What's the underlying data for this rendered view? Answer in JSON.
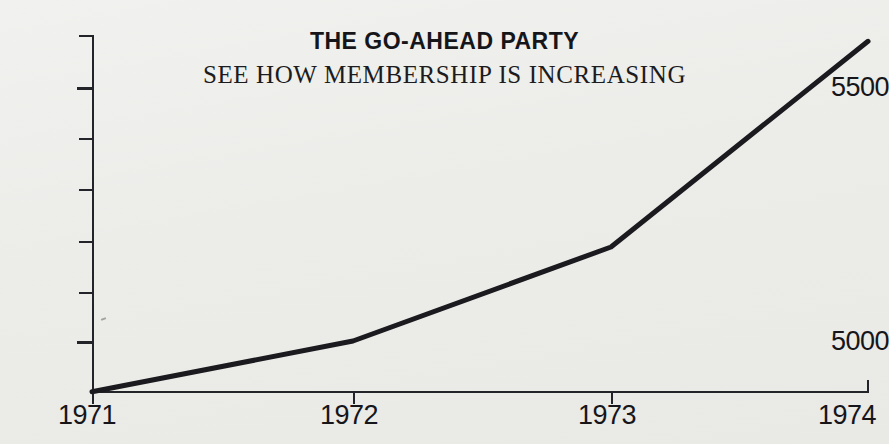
{
  "chart_data": {
    "type": "line",
    "title": "THE GO-AHEAD PARTY",
    "subtitle": "SEE HOW MEMBERSHIP IS INCREASING",
    "xlabel": "",
    "ylabel": "",
    "x": [
      "1971",
      "1972",
      "1973",
      "1974"
    ],
    "categories": [
      "1971",
      "1972",
      "1973",
      "1974"
    ],
    "values": [
      4900,
      5000,
      5185,
      5590
    ],
    "series": [
      {
        "name": "Membership",
        "values": [
          4900,
          5000,
          5185,
          5590
        ]
      }
    ],
    "xlim": [
      "1971",
      "1974"
    ],
    "ylim": [
      4900,
      5600
    ],
    "y_tick_labels": [
      "5500",
      "5000"
    ],
    "y_labeled_ticks": [
      5500,
      5000
    ],
    "y_minor_ticks": [
      5600,
      5400,
      5300,
      5200,
      5100
    ],
    "x_tick_labels": [
      "1971",
      "1972",
      "1973",
      "1974"
    ],
    "grid": false,
    "legend": false,
    "legend_position": "none",
    "line_color": "#1a1a1f",
    "background_color": "#eceae7",
    "note": "Truncated y-axis starting near 4900 exaggerates the rise in membership."
  },
  "axis": {
    "y_labels": [
      {
        "text": "5500"
      },
      {
        "text": "5000"
      }
    ],
    "x_labels": [
      {
        "text": "1971"
      },
      {
        "text": "1972"
      },
      {
        "text": "1973"
      },
      {
        "text": "1974"
      }
    ]
  }
}
